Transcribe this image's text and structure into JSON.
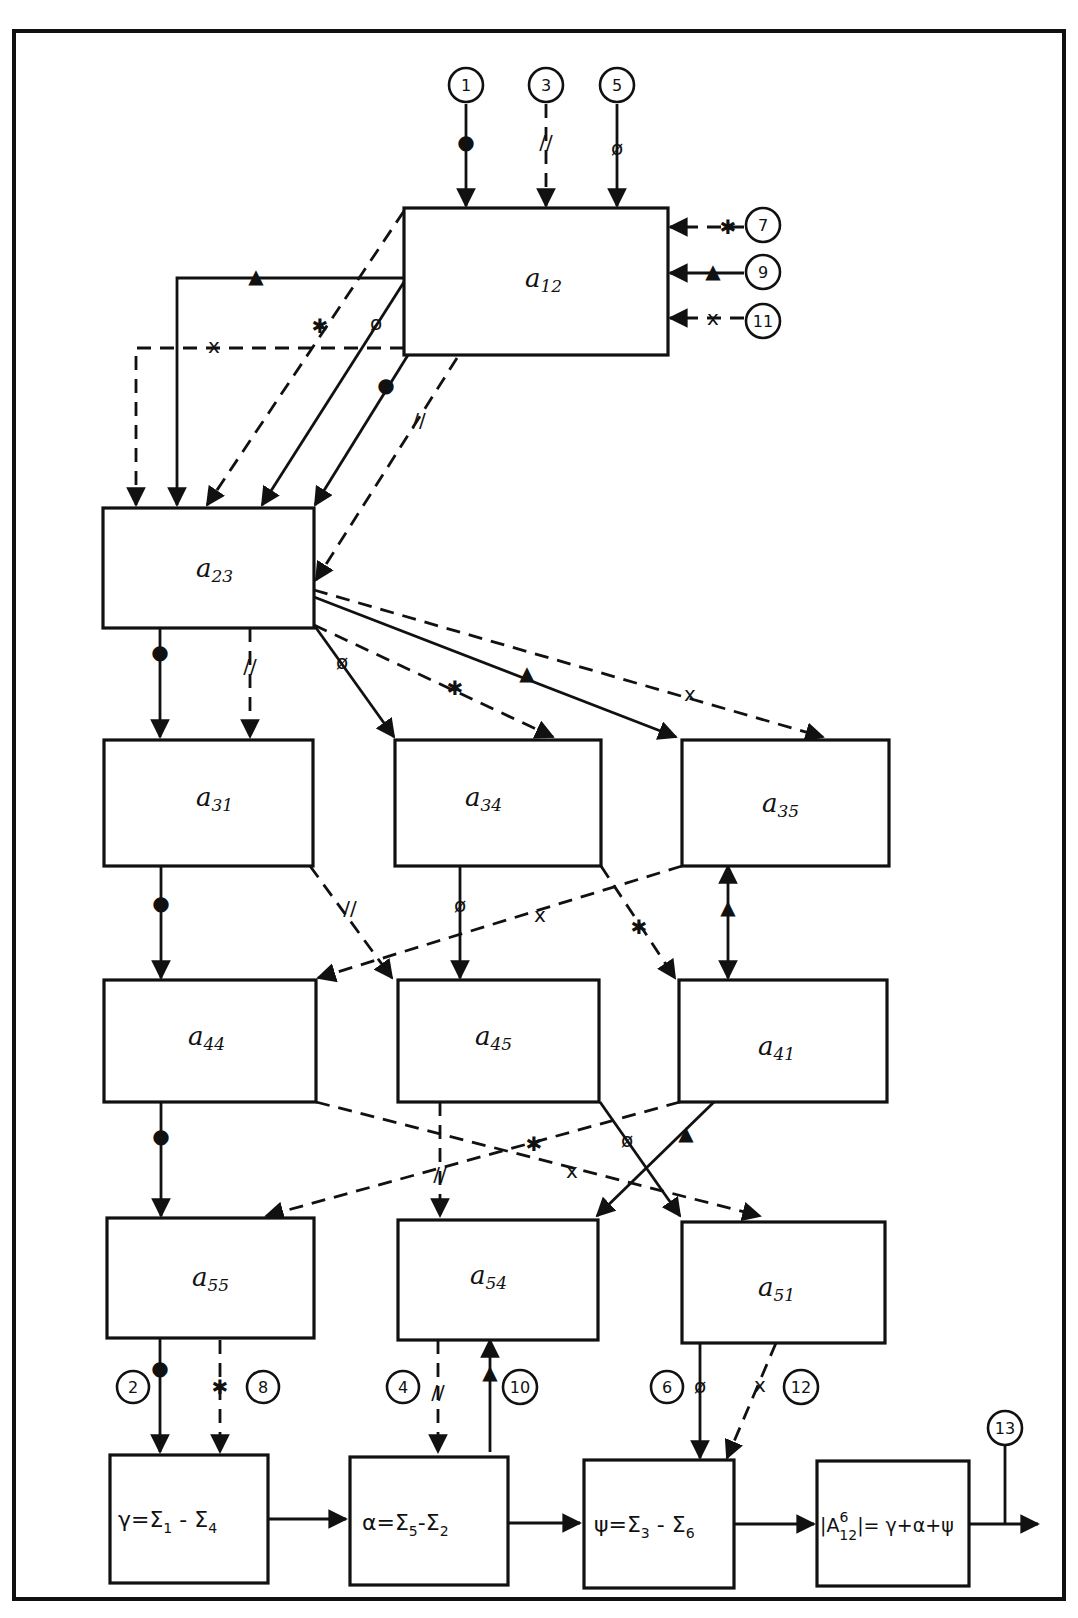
{
  "diagram": {
    "blocks": {
      "a12": {
        "letter": "a",
        "sub": "12"
      },
      "a23": {
        "letter": "a",
        "sub": "23"
      },
      "a31": {
        "letter": "a",
        "sub": "31"
      },
      "a34": {
        "letter": "a",
        "sub": "34"
      },
      "a35": {
        "letter": "a",
        "sub": "35"
      },
      "a44": {
        "letter": "a",
        "sub": "44"
      },
      "a45": {
        "letter": "a",
        "sub": "45"
      },
      "a41": {
        "letter": "a",
        "sub": "41"
      },
      "a55": {
        "letter": "a",
        "sub": "55"
      },
      "a54": {
        "letter": "a",
        "sub": "54"
      },
      "a51": {
        "letter": "a",
        "sub": "51"
      }
    },
    "formulas": {
      "gamma": {
        "lhs": "γ=",
        "s1": "Σ",
        "i1": "1",
        "op": " - ",
        "s2": "Σ",
        "i2": "4"
      },
      "alpha": {
        "lhs": "α=",
        "s1": "Σ",
        "i1": "5",
        "op": "-",
        "s2": "Σ",
        "i2": "2"
      },
      "psi": {
        "lhs": "ψ=",
        "s1": "Σ",
        "i1": "3",
        "op": " - ",
        "s2": "Σ",
        "i2": "6"
      },
      "result": {
        "lhs": "|A",
        "sup": "6",
        "sub": "12",
        "rhs": "|= γ+α+ψ"
      }
    },
    "nodes": {
      "n1": "1",
      "n2": "2",
      "n3": "3",
      "n4": "4",
      "n5": "5",
      "n6": "6",
      "n7": "7",
      "n8": "8",
      "n9": "9",
      "n10": "10",
      "n11": "11",
      "n12": "12",
      "n13": "13"
    },
    "marks": {
      "dot": "●",
      "double_slash": "//",
      "phi": "ø",
      "asterisk": "✱",
      "triangle": "▲",
      "cross": "x"
    },
    "legend_semantics": {
      "dot": "solid line with dot (path 1-2)",
      "double_slash": "dashed line with // (path 3-4)",
      "phi": "solid line with ø (path 5-6)",
      "asterisk": "dashed line with * (path 7-8)",
      "triangle": "solid line with ▲ (path 9-10)",
      "cross": "dashed line with x (path 11-12)"
    }
  }
}
